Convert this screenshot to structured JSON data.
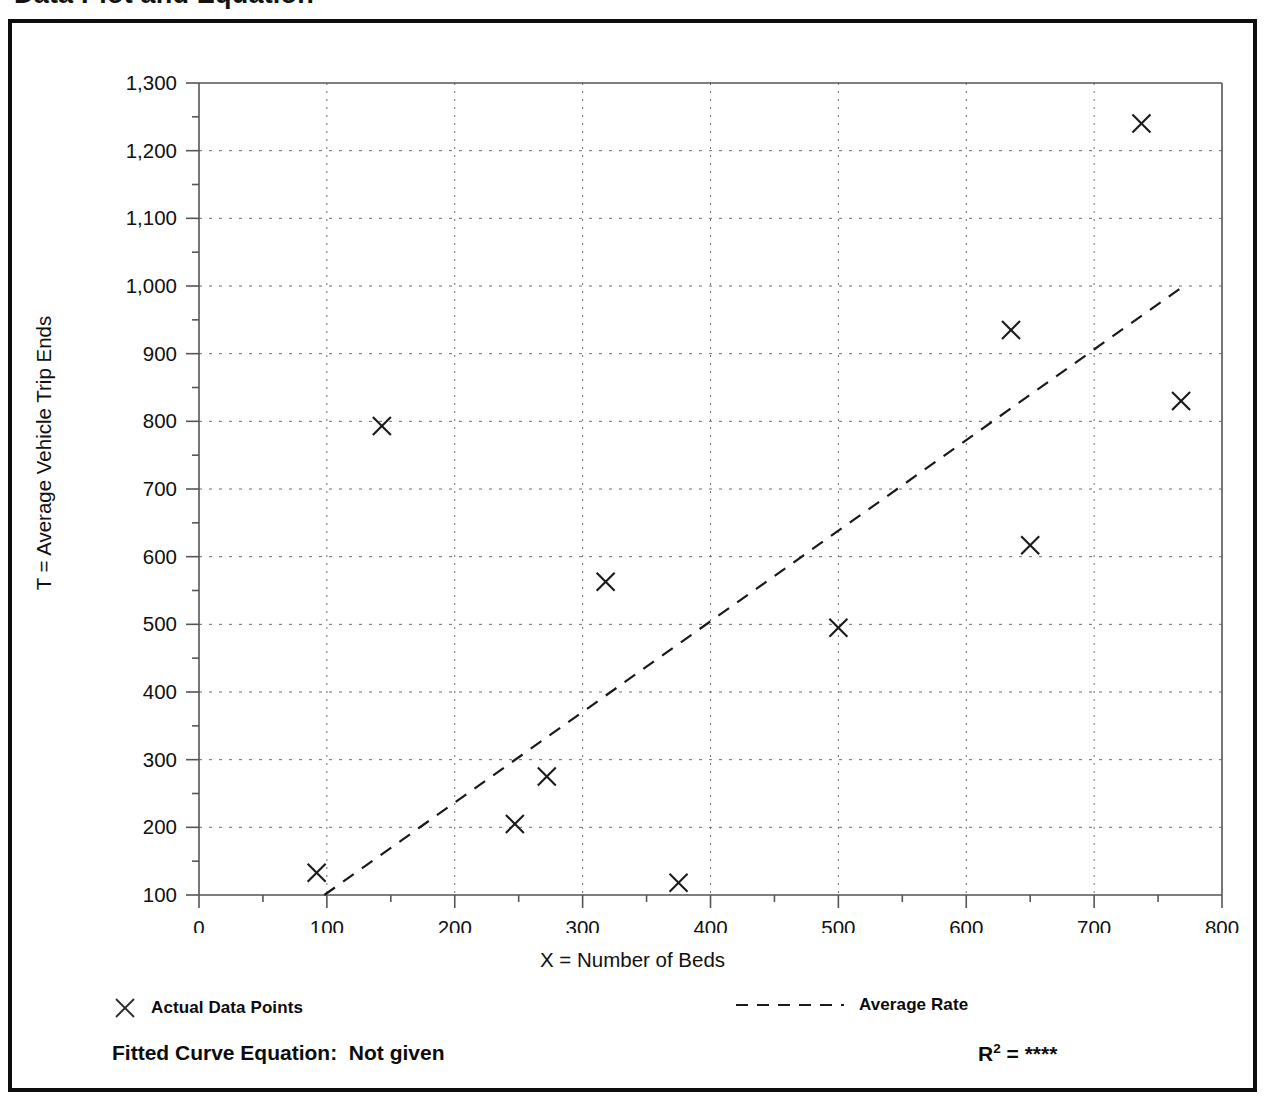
{
  "page": {
    "title": "Data Plot and Equation"
  },
  "figure": {
    "y_axis_title": "T = Average Vehicle Trip Ends",
    "x_axis_title": "X = Number of Beds",
    "legend": [
      {
        "key": "actual-data-points",
        "label": "Actual Data Points",
        "marker": "x-marker-icon"
      },
      {
        "key": "average-rate",
        "label": "Average Rate",
        "marker": "dashed-line-icon"
      }
    ],
    "fitted_curve_label": "Fitted Curve Equation:",
    "fitted_curve_value": "Not given",
    "r_squared_label": "R",
    "r_squared_exponent": "2",
    "r_squared_equals": " = ",
    "r_squared_value": "****"
  },
  "chart_data": {
    "type": "scatter",
    "title": "Data Plot and Equation",
    "xlabel": "X = Number of Beds",
    "ylabel": "T = Average Vehicle Trip Ends",
    "xlim": [
      0,
      800
    ],
    "ylim": [
      100,
      1300
    ],
    "x_ticks": [
      0,
      100,
      200,
      300,
      400,
      500,
      600,
      700,
      800
    ],
    "x_tick_labels": [
      "0",
      "100",
      "200",
      "300",
      "400",
      "500",
      "600",
      "700",
      "800"
    ],
    "x_minor_tick_interval": 50,
    "y_ticks": [
      100,
      200,
      300,
      400,
      500,
      600,
      700,
      800,
      900,
      1000,
      1100,
      1200,
      1300
    ],
    "y_tick_labels": [
      "100",
      "200",
      "300",
      "400",
      "500",
      "600",
      "700",
      "800",
      "900",
      "1,000",
      "1,100",
      "1,200",
      "1,300"
    ],
    "y_minor_tick_interval": 50,
    "grid": true,
    "grid_style": "dotted",
    "legend_position": "below-axes",
    "series": [
      {
        "name": "Actual Data Points",
        "type": "scatter",
        "marker": "x",
        "color": "#1a1a1a",
        "points": [
          {
            "x": 92,
            "y": 133
          },
          {
            "x": 143,
            "y": 793
          },
          {
            "x": 247,
            "y": 205
          },
          {
            "x": 272,
            "y": 275
          },
          {
            "x": 318,
            "y": 563
          },
          {
            "x": 375,
            "y": 118
          },
          {
            "x": 500,
            "y": 495
          },
          {
            "x": 635,
            "y": 935
          },
          {
            "x": 650,
            "y": 617
          },
          {
            "x": 737,
            "y": 1240
          },
          {
            "x": 768,
            "y": 830
          }
        ]
      },
      {
        "name": "Average Rate",
        "type": "line",
        "style": "dashed",
        "color": "#1a1a1a",
        "points": [
          {
            "x": 98,
            "y": 100
          },
          {
            "x": 770,
            "y": 1000
          }
        ]
      }
    ]
  }
}
